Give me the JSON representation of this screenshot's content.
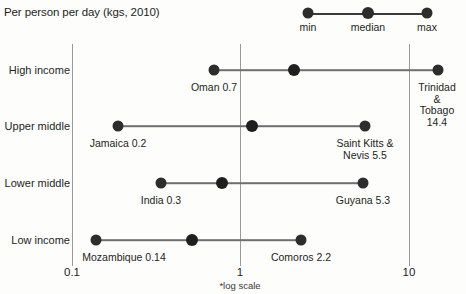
{
  "chart_data": {
    "type": "scatter",
    "title": "Per person per day (kgs, 2010)",
    "xlabel": "",
    "ylabel": "",
    "footnote": "*log scale",
    "scale": "log",
    "xlim": [
      0.1,
      20
    ],
    "grid": true,
    "legend_position": "top",
    "xticks": [
      {
        "value": 0.1,
        "label": "0.1",
        "px": 72
      },
      {
        "value": 1,
        "label": "1",
        "px": 240
      },
      {
        "value": 10,
        "label": "10",
        "px": 409
      }
    ],
    "legend": [
      {
        "name": "min",
        "px": 158
      },
      {
        "name": "median",
        "px": 218
      },
      {
        "name": "max",
        "px": 277
      }
    ],
    "categories": [
      "High income",
      "Upper middle",
      "Lower middle",
      "Low income"
    ],
    "series": [
      {
        "name": "min",
        "values": [
          0.7,
          0.2,
          0.3,
          0.14
        ]
      },
      {
        "name": "median",
        "values": [
          2.1,
          1.2,
          0.78,
          0.6
        ]
      },
      {
        "name": "max",
        "values": [
          14.4,
          5.5,
          5.3,
          2.2
        ]
      }
    ],
    "rows": [
      {
        "category": "High income",
        "y": 26,
        "min": {
          "value": 0.7,
          "px": 214,
          "label": "Oman 0.7",
          "label_px": 214,
          "label_y": 38
        },
        "median": {
          "value": 2.1,
          "px": 294
        },
        "max": {
          "value": 14.4,
          "px": 438,
          "label": "Trinidad &\nTobago\n14.4",
          "label_px": 437,
          "label_y": 38
        }
      },
      {
        "category": "Upper middle",
        "y": 82,
        "min": {
          "value": 0.2,
          "px": 118,
          "label": "Jamaica 0.2",
          "label_px": 118,
          "label_y": 94
        },
        "median": {
          "value": 1.2,
          "px": 252
        },
        "max": {
          "value": 5.5,
          "px": 365,
          "label": "Saint Kitts &\nNevis 5.5",
          "label_px": 365,
          "label_y": 94
        }
      },
      {
        "category": "Lower middle",
        "y": 139,
        "min": {
          "value": 0.3,
          "px": 161,
          "label": "India 0.3",
          "label_px": 161,
          "label_y": 151
        },
        "median": {
          "value": 0.78,
          "px": 222
        },
        "max": {
          "value": 5.3,
          "px": 363,
          "label": "Guyana 5.3",
          "label_px": 363,
          "label_y": 151
        }
      },
      {
        "category": "Low income",
        "y": 196,
        "min": {
          "value": 0.14,
          "px": 96,
          "label": "Mozambique 0.14",
          "label_px": 124,
          "label_y": 208
        },
        "median": {
          "value": 0.6,
          "px": 192
        },
        "max": {
          "value": 2.2,
          "px": 301,
          "label": "Comoros 2.2",
          "label_px": 301,
          "label_y": 208
        }
      }
    ]
  },
  "colors": {
    "dot": "#2d2d2d",
    "line": "#6f6f6f",
    "grid": "#9a9a9a",
    "text": "#231f20",
    "background": "#fdfdfc"
  }
}
